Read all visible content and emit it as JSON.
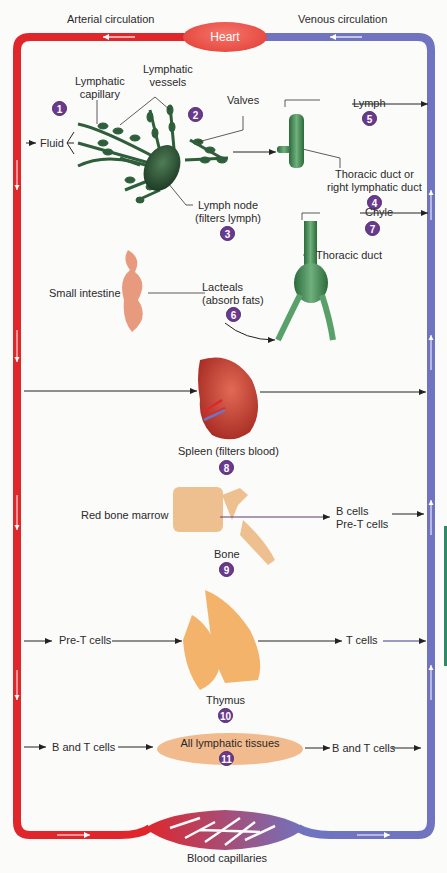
{
  "diagram": {
    "type": "lymphatic-system-flow",
    "colors": {
      "arterial": "#e0262a",
      "venous": "#7073c0",
      "lymph_green": "#2f5e3a",
      "badge": "#6a3a8e",
      "tissue_fill": "#f1bb8e"
    },
    "top": {
      "arterial_label": "Arterial circulation",
      "venous_label": "Venous circulation",
      "heart_label": "Heart"
    },
    "bottom": {
      "capillaries_label": "Blood capillaries"
    },
    "steps": [
      {
        "number": "1",
        "labels": [
          "Lymphatic",
          "capillary"
        ],
        "input_label": "Fluid"
      },
      {
        "number": "2",
        "labels": [
          "Lymphatic",
          "vessels"
        ],
        "valves_label": "Valves"
      },
      {
        "number": "3",
        "labels": [
          "Lymph node",
          "(filters lymph)"
        ]
      },
      {
        "number": "4",
        "labels": [
          "Thoracic duct or",
          "right lymphatic duct"
        ]
      },
      {
        "number": "5",
        "labels": [
          "Lymph"
        ]
      },
      {
        "number": "6",
        "labels": [
          "Lacteals",
          "(absorb fats)"
        ],
        "organ_label": "Small intestine"
      },
      {
        "number": "7",
        "labels": [
          "Chyle"
        ],
        "duct_label": "Thoracic duct"
      },
      {
        "number": "8",
        "labels": [
          "Spleen (filters blood)"
        ]
      },
      {
        "number": "9",
        "labels": [
          "Bone"
        ],
        "organ_label": "Red bone marrow",
        "outputs": [
          "B cells",
          "Pre-T cells"
        ]
      },
      {
        "number": "10",
        "labels": [
          "Thymus"
        ],
        "input_label": "Pre-T cells",
        "output_label": "T cells"
      },
      {
        "number": "11",
        "labels": [
          "All lymphatic tissues"
        ],
        "input_label": "B and T cells",
        "output_label": "B and T cells"
      }
    ]
  }
}
